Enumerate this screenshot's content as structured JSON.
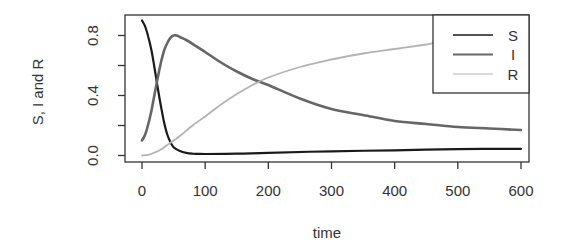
{
  "chart_data": {
    "type": "line",
    "title": "",
    "xlabel": "time",
    "ylabel": "S, I and R",
    "xlim": [
      0,
      600
    ],
    "ylim": [
      0,
      0.9
    ],
    "x_ticks": [
      0,
      100,
      200,
      300,
      400,
      500,
      600
    ],
    "x_tick_labels": [
      "0",
      "100",
      "200",
      "300",
      "400",
      "500",
      "600"
    ],
    "y_ticks": [
      0.0,
      0.2,
      0.4,
      0.6,
      0.8
    ],
    "y_tick_labels": [
      "0.0",
      "",
      "0.4",
      "",
      "0.8"
    ],
    "grid": false,
    "legend_position": "top-right",
    "series": [
      {
        "name": "S",
        "color": "#1a1a1a",
        "x": [
          0,
          5,
          10,
          15,
          20,
          25,
          30,
          35,
          40,
          45,
          50,
          60,
          70,
          80,
          90,
          100,
          150,
          200,
          300,
          400,
          500,
          600
        ],
        "y": [
          0.9,
          0.86,
          0.79,
          0.7,
          0.58,
          0.45,
          0.33,
          0.22,
          0.14,
          0.09,
          0.055,
          0.03,
          0.018,
          0.013,
          0.011,
          0.01,
          0.012,
          0.018,
          0.028,
          0.035,
          0.042,
          0.045
        ]
      },
      {
        "name": "I",
        "color": "#666666",
        "x": [
          0,
          5,
          10,
          15,
          20,
          25,
          30,
          35,
          40,
          45,
          50,
          55,
          60,
          70,
          80,
          100,
          125,
          150,
          175,
          200,
          250,
          300,
          350,
          400,
          450,
          500,
          550,
          600
        ],
        "y": [
          0.1,
          0.14,
          0.21,
          0.3,
          0.41,
          0.52,
          0.62,
          0.7,
          0.75,
          0.785,
          0.8,
          0.8,
          0.79,
          0.77,
          0.745,
          0.69,
          0.62,
          0.56,
          0.51,
          0.47,
          0.38,
          0.31,
          0.27,
          0.23,
          0.21,
          0.19,
          0.18,
          0.17
        ]
      },
      {
        "name": "R",
        "color": "#b3b3b3",
        "x": [
          0,
          10,
          20,
          30,
          40,
          50,
          60,
          80,
          100,
          125,
          150,
          175,
          200,
          250,
          300,
          350,
          400,
          450,
          460
        ],
        "y": [
          0.0,
          0.005,
          0.02,
          0.04,
          0.07,
          0.1,
          0.13,
          0.2,
          0.26,
          0.34,
          0.41,
          0.47,
          0.52,
          0.59,
          0.64,
          0.68,
          0.71,
          0.74,
          0.75
        ]
      }
    ],
    "legend": [
      {
        "label": "S",
        "color": "#1a1a1a"
      },
      {
        "label": "I",
        "color": "#666666"
      },
      {
        "label": "R",
        "color": "#b3b3b3"
      }
    ]
  }
}
